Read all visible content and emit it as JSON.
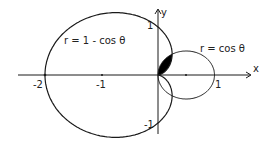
{
  "diagram": {
    "title": "",
    "curves": [
      {
        "name": "cardioid",
        "label": "r = 1 - cos θ"
      },
      {
        "name": "circle",
        "label": "r = cos θ"
      }
    ],
    "axes": {
      "x_label": "x",
      "y_label": "y",
      "x_ticks": [
        "-2",
        "-1",
        "1"
      ],
      "y_ticks": [
        "1",
        "-1"
      ]
    },
    "shaded_region": "intersection of r = cos θ and r = 1 - cos θ in upper half-plane",
    "colors": {
      "ink": "#1a1a1a",
      "background": "#ffffff",
      "shade": "#000000"
    }
  }
}
